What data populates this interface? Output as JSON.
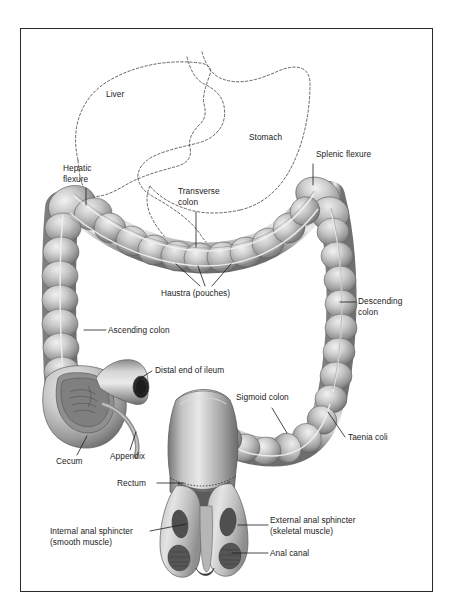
{
  "figure": {
    "style": "grayscale medical illustration with dashed outlines of liver and stomach",
    "frame_color": "#2b2b2e",
    "background_color": "#ffffff"
  },
  "palette": {
    "colon_mid": "#9a9a9a",
    "colon_light": "#d8d8d8",
    "colon_highlight": "#efefef",
    "colon_shadow": "#6a6a6a",
    "colon_outline": "#5c5c5c",
    "muscle_dark": "#5a5a5a",
    "dashed_outline": "#4a4a4a",
    "leader_line": "#1a1a1a",
    "text": "#1a1a1a"
  },
  "labels": {
    "liver": "Liver",
    "stomach": "Stomach",
    "hepatic_flexure": "Hepatic\nflexure",
    "splenic_flexure": "Splenic flexure",
    "transverse_colon": "Transverse\ncolon",
    "haustra": "Haustra (pouches)",
    "descending_colon": "Descending\ncolon",
    "ascending_colon": "Ascending colon",
    "distal_ileum": "Distal end of ileum",
    "sigmoid_colon": "Sigmoid colon",
    "taenia_coli": "Taenia coli",
    "cecum": "Cecum",
    "appendix": "Appendix",
    "rectum": "Rectum",
    "internal_anal_sphincter": "Internal anal sphincter\n(smooth muscle)",
    "external_anal_sphincter": "External anal sphincter\n(skeletal muscle)",
    "anal_canal": "Anal canal"
  }
}
